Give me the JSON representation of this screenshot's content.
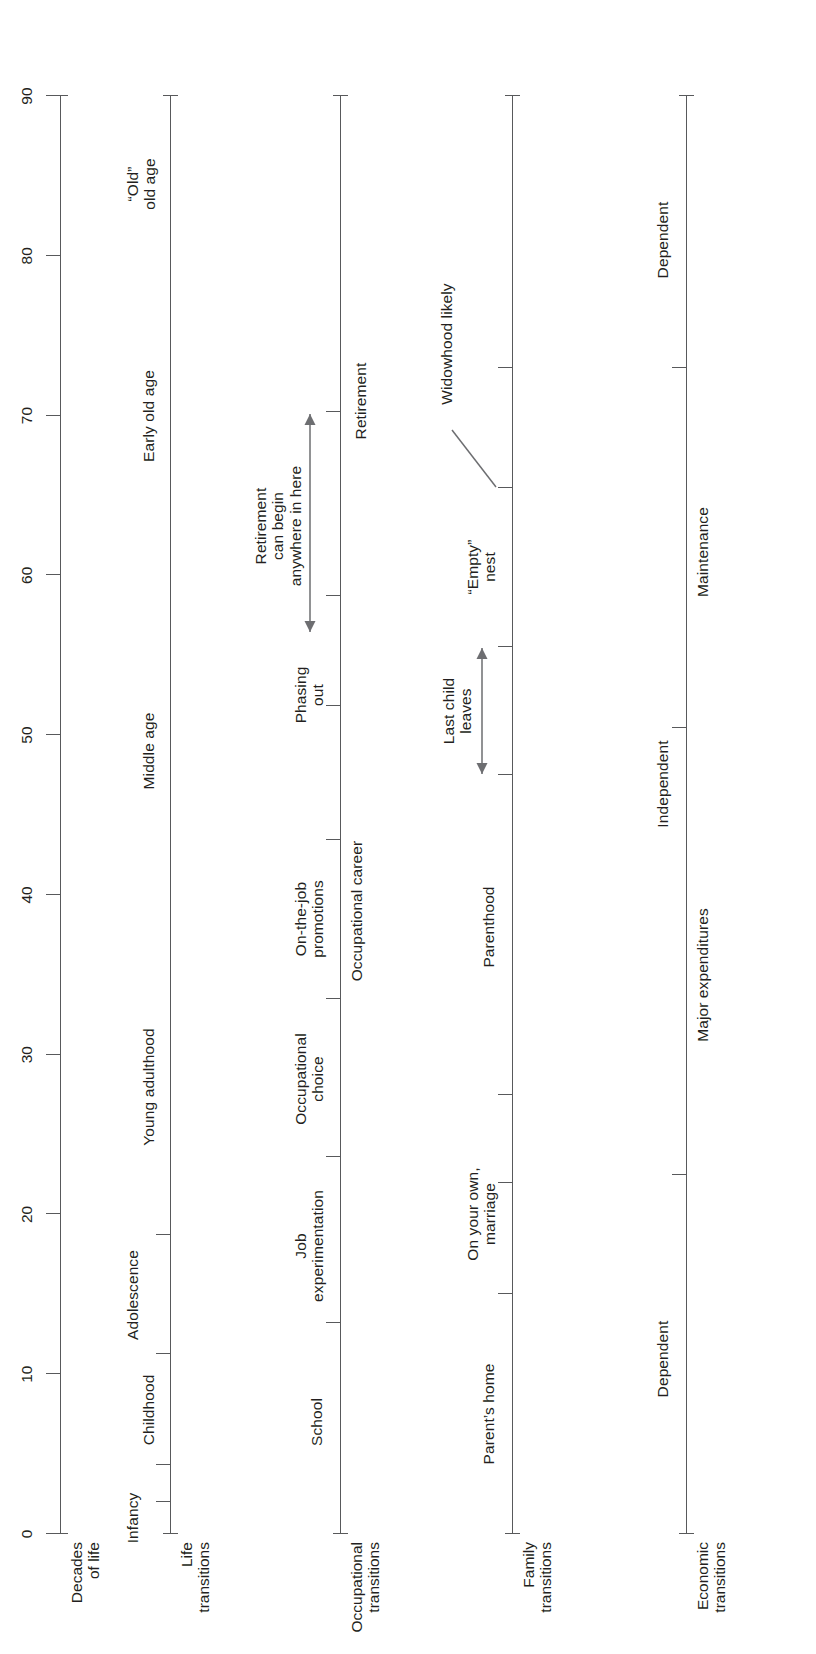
{
  "figure": {
    "orientation": "rotated-90",
    "scale": {
      "min": 0,
      "max": 90,
      "step": 10,
      "ticks": [
        "0",
        "10",
        "20",
        "30",
        "40",
        "50",
        "60",
        "70",
        "80",
        "90"
      ]
    },
    "ink_color": "#231f20",
    "line_color": "#58595b",
    "arrow_color": "#6d6e71"
  },
  "rows": [
    {
      "id": "decades",
      "name": "Decades\nof life",
      "ticks": [
        0,
        10,
        20,
        30,
        40,
        50,
        60,
        70,
        80,
        90
      ],
      "segments": [],
      "annotations": []
    },
    {
      "id": "life",
      "name": "Life\ntransitions",
      "ticks": [
        2,
        4.3,
        11.3,
        18.7
      ],
      "segments": [
        {
          "label": "Infancy",
          "start": 0,
          "end": 2,
          "at": 1.0,
          "align": "above-left"
        },
        {
          "label": "Childhood",
          "start": 4.3,
          "end": 11.3,
          "at": 7.8
        },
        {
          "label": "Adolescence",
          "start": 11.3,
          "end": 18.7,
          "at": 15.0
        },
        {
          "label": "Young adulthood",
          "start": 18.7,
          "end": 38,
          "at": 28.0
        },
        {
          "label": "Middle age",
          "start": 38,
          "end": 60,
          "at": 49.0
        },
        {
          "label": "Early old age",
          "start": 60,
          "end": 80,
          "at": 70.0
        },
        {
          "label": "“Old”\nold age",
          "start": 80,
          "end": 90,
          "at": 84.5
        }
      ],
      "annotations": []
    },
    {
      "id": "occupational",
      "name": "Occupational\ntransitions",
      "ticks": [
        13.2,
        23.6,
        33.5,
        43.4,
        51.8,
        58.7,
        70.2
      ],
      "segments": [
        {
          "label": "School",
          "at": 7.0
        },
        {
          "label": "Job\nexperimentation",
          "at": 18.0
        },
        {
          "label": "Occupational\nchoice",
          "at": 28.5
        },
        {
          "label": "On-the-job\npromotions",
          "at": 38.5
        },
        {
          "label": "Phasing\nout",
          "at": 52.5
        }
      ],
      "below_labels": [
        {
          "label": "Occupational career",
          "at": 39.0
        }
      ],
      "annotations": [
        {
          "type": "double-arrow",
          "label": "Retirement\ncan begin\nanywhere in here",
          "start": 56.5,
          "end": 70.0,
          "label_at": 63.0
        },
        {
          "type": "text-below",
          "label": "Retirement",
          "at": 70.8
        }
      ]
    },
    {
      "id": "family",
      "name": "Family\ntransitions",
      "ticks": [
        15.0,
        22.0,
        27.5,
        47.5,
        55.5,
        65.5,
        73.0
      ],
      "segments": [
        {
          "label": "Parent’s home",
          "at": 7.5
        },
        {
          "label": "On your own,\nmarriage",
          "at": 20.0
        },
        {
          "label": "Parenthood",
          "at": 38.0
        },
        {
          "label": "“Empty”\nnest",
          "at": 60.5
        }
      ],
      "below_labels": [],
      "annotations": [
        {
          "type": "double-arrow",
          "label": "Last child\nleaves",
          "start": 47.5,
          "end": 55.5,
          "label_at": 51.5
        },
        {
          "type": "leader-text",
          "label": "Widowhood likely",
          "at": 65.5,
          "text_at": 77.0
        }
      ]
    },
    {
      "id": "economic",
      "name": "Economic\ntransitions",
      "ticks": [
        22.5,
        50.5,
        73.0
      ],
      "segments": [
        {
          "label": "Dependent",
          "at": 11.0
        },
        {
          "label": "Independent",
          "at": 47.0
        },
        {
          "label": "Dependent",
          "at": 81.0
        }
      ],
      "below_labels": [
        {
          "label": "Major expenditures",
          "at": 35.0
        },
        {
          "label": "Maintenance",
          "at": 61.5
        }
      ],
      "annotations": []
    }
  ]
}
